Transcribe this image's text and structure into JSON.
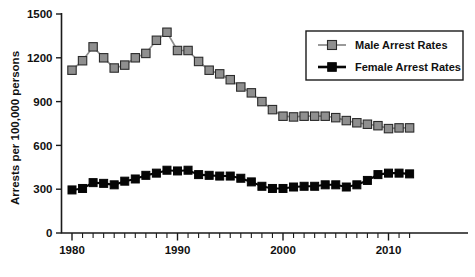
{
  "chart_data": {
    "type": "line",
    "title": "",
    "xlabel": "",
    "ylabel": "Arrests per 100,000 persons",
    "xlim": [
      1979,
      2013
    ],
    "ylim": [
      0,
      1500
    ],
    "yticks": [
      0,
      300,
      600,
      900,
      1200,
      1500
    ],
    "xticks_labeled": [
      1980,
      1990,
      2000,
      2010
    ],
    "xticks_minor_interval": 1,
    "grid": false,
    "legend_position": "top-right",
    "x": [
      1980,
      1981,
      1982,
      1983,
      1984,
      1985,
      1986,
      1987,
      1988,
      1989,
      1990,
      1991,
      1992,
      1993,
      1994,
      1995,
      1996,
      1997,
      1998,
      1999,
      2000,
      2001,
      2002,
      2003,
      2004,
      2005,
      2006,
      2007,
      2008,
      2009,
      2010,
      2011,
      2012
    ],
    "series": [
      {
        "name": "Male Arrest Rates",
        "color": "#8f8f8f",
        "marker": "square",
        "values": [
          1115,
          1180,
          1275,
          1200,
          1130,
          1150,
          1200,
          1230,
          1320,
          1375,
          1250,
          1250,
          1175,
          1115,
          1090,
          1050,
          1000,
          960,
          900,
          845,
          800,
          795,
          800,
          800,
          800,
          790,
          770,
          755,
          745,
          735,
          715,
          720,
          720
        ]
      },
      {
        "name": "Female Arrest Rates",
        "color": "#050505",
        "marker": "square",
        "values": [
          295,
          305,
          345,
          340,
          330,
          355,
          370,
          395,
          410,
          430,
          425,
          430,
          400,
          395,
          390,
          390,
          375,
          350,
          320,
          305,
          305,
          315,
          320,
          320,
          330,
          330,
          315,
          330,
          360,
          400,
          410,
          410,
          405
        ]
      }
    ]
  },
  "legend": {
    "entries": [
      {
        "label": "Male Arrest Rates"
      },
      {
        "label": "Female Arrest Rates"
      }
    ]
  },
  "axis": {
    "y_label": "Arrests per 100,000 persons",
    "y_tick_labels": [
      "0",
      "300",
      "600",
      "900",
      "1200",
      "1500"
    ],
    "x_tick_labels": [
      "1980",
      "1990",
      "2000",
      "2010"
    ]
  }
}
